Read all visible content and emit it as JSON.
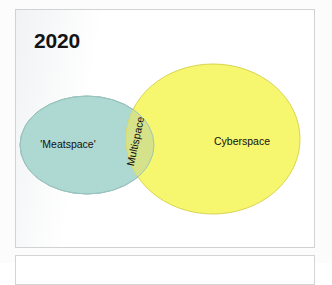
{
  "figure": {
    "title": "2020",
    "sets": [
      {
        "id": "meatspace",
        "label": "'Meatspace'",
        "color": "#aed8d2",
        "stroke": "#8fbdb7",
        "shape": "ellipse",
        "cx": 87,
        "cy": 145,
        "rx": 67,
        "ry": 49
      },
      {
        "id": "cyberspace",
        "label": "Cyberspace",
        "color": "#f7f66a",
        "stroke": "#d8d54e",
        "shape": "ellipse",
        "cx": 213,
        "cy": 139,
        "rx": 87,
        "ry": 75
      }
    ],
    "intersection": {
      "id": "multispace",
      "label": "Multispace",
      "color": "#d3e08a",
      "rotation_deg": -78
    },
    "diagram_type": "venn"
  },
  "chart_data": {
    "type": "venn",
    "title": "2020",
    "sets": [
      "'Meatspace'",
      "Cyberspace"
    ],
    "intersection_label": "Multispace",
    "set_colors": [
      "#aed8d2",
      "#f7f66a"
    ],
    "intersection_color": "#d3e08a",
    "legend": "none",
    "grid": false
  }
}
